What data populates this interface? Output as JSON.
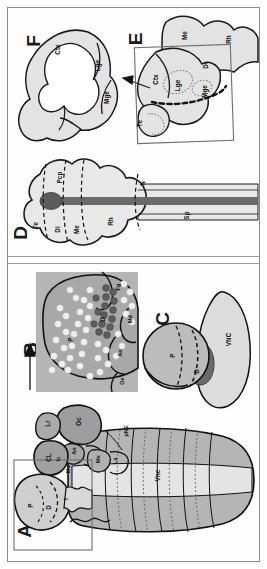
{
  "figure": {
    "orientation": "rotated-90-ccw",
    "panel_letters": [
      "A",
      "B",
      "C",
      "D",
      "E",
      "F"
    ],
    "sections": {
      "top_label": "vertebrate",
      "bottom_label": "invertebrate"
    },
    "colors": {
      "outline": "#1a1a1a",
      "frame": "#8a8a8a",
      "fill_light": "#e8e8e8",
      "fill_mid": "#c9c9c9",
      "fill_dark": "#8f8f8f",
      "fill_darker": "#6d6d6d",
      "notochord": "#6a6a6a",
      "background": "#fefefe"
    }
  },
  "panels": {
    "A": {
      "letter": "A",
      "labels": [
        {
          "id": "oc",
          "text": "Oc"
        },
        {
          "id": "lr",
          "text": "Lr"
        },
        {
          "id": "an",
          "text": "An"
        },
        {
          "id": "ic",
          "text": "Ic"
        },
        {
          "id": "md",
          "text": "Md"
        },
        {
          "id": "mx",
          "text": "Mx"
        },
        {
          "id": "la",
          "text": "La"
        },
        {
          "id": "cl",
          "text": "CL"
        },
        {
          "id": "p",
          "text": "P"
        },
        {
          "id": "d",
          "text": "D"
        },
        {
          "id": "t",
          "text": "T"
        },
        {
          "id": "pne",
          "text": "pNE"
        },
        {
          "id": "vnc",
          "text": "Vnc"
        }
      ],
      "has_inset_box": true
    },
    "B": {
      "letter": "B",
      "labels": [
        {
          "id": "fg",
          "text": "Fg"
        },
        {
          "id": "md",
          "text": "Md"
        },
        {
          "id": "an",
          "text": "An"
        },
        {
          "id": "d",
          "text": "D"
        },
        {
          "id": "p",
          "text": "P"
        },
        {
          "id": "oe",
          "text": "Oe"
        }
      ],
      "arrow_from": "A",
      "has_arrow": true
    },
    "C": {
      "letter": "C",
      "labels": [
        {
          "id": "p",
          "text": "P"
        },
        {
          "id": "d",
          "text": "D"
        },
        {
          "id": "vnc",
          "text": "VNC"
        }
      ]
    },
    "D": {
      "letter": "D",
      "labels": [
        {
          "id": "te",
          "text": "Te"
        },
        {
          "id": "di",
          "text": "Di"
        },
        {
          "id": "me",
          "text": "Me"
        },
        {
          "id": "rh",
          "text": "Rh"
        },
        {
          "id": "sp",
          "text": "Sp"
        },
        {
          "id": "n",
          "text": "N"
        },
        {
          "id": "pcp",
          "text": "Pcp"
        }
      ]
    },
    "E": {
      "letter": "E",
      "labels": [
        {
          "id": "me",
          "text": "Me"
        },
        {
          "id": "rh",
          "text": "Rh"
        },
        {
          "id": "ctx",
          "text": "Ctx"
        },
        {
          "id": "lge",
          "text": "Lge"
        },
        {
          "id": "mge",
          "text": "Mge"
        },
        {
          "id": "di",
          "text": "Di"
        },
        {
          "id": "te",
          "text": "Te"
        }
      ],
      "has_inset_box": true,
      "has_arrow": true
    },
    "F": {
      "letter": "F",
      "labels": [
        {
          "id": "ctx",
          "text": "Ctx"
        },
        {
          "id": "lge",
          "text": "Lge"
        },
        {
          "id": "mge",
          "text": "Mge"
        }
      ]
    }
  }
}
